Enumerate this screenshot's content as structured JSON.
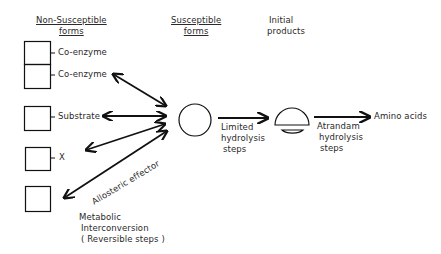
{
  "headers": {
    "non_susceptible": [
      "Non-Susceptible",
      "forms"
    ],
    "susceptible": [
      "Susceptible",
      "forms"
    ],
    "initial_products": [
      "Initial",
      "products"
    ]
  },
  "non_susceptible_forms": [
    {
      "label": "Co-enzyme"
    },
    {
      "label": "Co-enzyme"
    },
    {
      "label": "Substrate"
    },
    {
      "label": "X"
    },
    {
      "label": ""
    }
  ],
  "annotations": {
    "allosteric": "Allosteric effector",
    "metabolic": [
      "Metabolic",
      "Interconversion",
      "( Reversible steps )"
    ],
    "limited": [
      "Limited",
      "hydrolysis",
      "steps"
    ],
    "atrandam": [
      "Atrandam",
      "hydrolysis",
      "steps"
    ],
    "end_product": "Amino acids"
  },
  "colors": {
    "line": "#111111",
    "text": "#2a2a2a",
    "background": "#ffffff"
  }
}
